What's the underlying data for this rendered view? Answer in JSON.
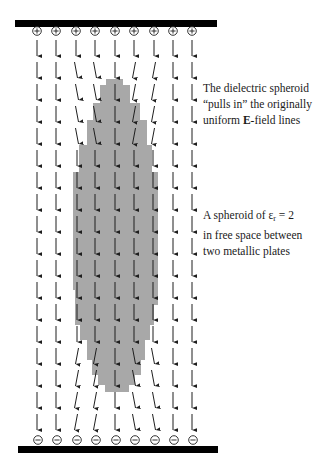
{
  "figure": {
    "width": 314,
    "height": 466,
    "colors": {
      "plate": "#000000",
      "spheroid": "#a8a8a8",
      "arrow": "#1e1e1e",
      "background": "#ffffff"
    },
    "top_plate": {
      "x": 15,
      "y": 20,
      "width": 202,
      "height": 7,
      "charge": "+"
    },
    "bottom_plate": {
      "x": 18,
      "y": 446,
      "width": 200,
      "height": 7,
      "charge": "−"
    },
    "charge_x": [
      37,
      56,
      76,
      95,
      115,
      134,
      154,
      173,
      192
    ],
    "top_charge_y": 31,
    "bottom_charge_y": 440,
    "spheroid": {
      "label": "dielectric spheroid",
      "permittivity": "εr = 2",
      "steps": [
        {
          "y": 79,
          "left": 106,
          "right": 123
        },
        {
          "y": 85,
          "left": 100,
          "right": 130
        },
        {
          "y": 103,
          "left": 93,
          "right": 140
        },
        {
          "y": 120,
          "left": 87,
          "right": 147
        },
        {
          "y": 145,
          "left": 79,
          "right": 152
        },
        {
          "y": 172,
          "left": 73,
          "right": 158
        },
        {
          "y": 290,
          "left": 75,
          "right": 158
        },
        {
          "y": 305,
          "left": 75,
          "right": 154
        },
        {
          "y": 325,
          "left": 80,
          "right": 150
        },
        {
          "y": 340,
          "left": 87,
          "right": 145
        },
        {
          "y": 360,
          "left": 92,
          "right": 141
        },
        {
          "y": 375,
          "left": 98,
          "right": 135
        },
        {
          "y": 385,
          "left": 105,
          "right": 129
        },
        {
          "y": 392,
          "left": 108,
          "right": 123
        }
      ]
    },
    "field_rows_y": [
      40,
      62,
      84,
      106,
      128,
      150,
      172,
      194,
      216,
      238,
      260,
      282,
      304,
      326,
      348,
      370,
      392,
      414
    ],
    "arrow_length": 16
  },
  "annotations": [
    {
      "id": "pulls-in-note",
      "top": 80,
      "lines": [
        {
          "parts": [
            {
              "text": "The dielectric spheroid"
            }
          ]
        },
        {
          "parts": [
            {
              "text": "“pulls in” the originally"
            }
          ]
        },
        {
          "parts": [
            {
              "text": "uniform "
            },
            {
              "text": "E",
              "style": "bold"
            },
            {
              "text": "-field lines"
            }
          ]
        }
      ]
    },
    {
      "id": "spheroid-note",
      "top": 207,
      "lines": [
        {
          "parts": [
            {
              "text": "A spheroid of ε"
            },
            {
              "text": "r",
              "style": "sub"
            },
            {
              "text": " = 2"
            }
          ]
        },
        {
          "parts": [
            {
              "text": "in free space between"
            }
          ]
        },
        {
          "parts": [
            {
              "text": "two metallic plates"
            }
          ]
        }
      ]
    }
  ]
}
